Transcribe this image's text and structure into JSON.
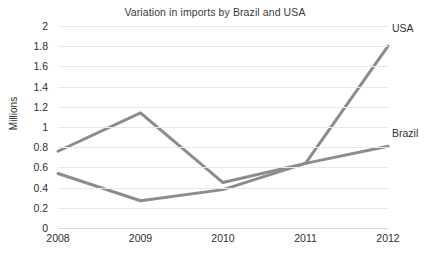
{
  "chart_data": {
    "type": "line",
    "title": "Variation in imports by Brazil and USA",
    "xlabel": "",
    "ylabel": "Millions",
    "categories": [
      "2008",
      "2009",
      "2010",
      "2011",
      "2012"
    ],
    "x": [
      2008,
      2009,
      2010,
      2011,
      2012
    ],
    "series": [
      {
        "name": "USA",
        "values": [
          0.76,
          1.14,
          0.45,
          0.64,
          1.8
        ],
        "color": "#8c8c8c",
        "label_position": "end-top"
      },
      {
        "name": "Brazil",
        "values": [
          0.54,
          0.27,
          0.38,
          0.64,
          0.81
        ],
        "color": "#8c8c8c",
        "label_position": "end-bottom"
      }
    ],
    "ylim": [
      0,
      2
    ],
    "ytick_step": 0.2,
    "ytick_labels": [
      "2",
      "1.8",
      "1.6",
      "1.4",
      "1.2",
      "1",
      "0.8",
      "0.6",
      "0.4",
      "0.2",
      "0"
    ],
    "ytick_values": [
      2,
      1.8,
      1.6,
      1.4,
      1.2,
      1,
      0.8,
      0.6,
      0.4,
      0.2,
      0
    ],
    "grid": true,
    "grid_color": "#e8e8e8",
    "legend": "series-end-labels",
    "markers": false,
    "line_width": 3,
    "background": "#ffffff"
  },
  "labels": {
    "series_usa": "USA",
    "series_brazil": "Brazil"
  }
}
